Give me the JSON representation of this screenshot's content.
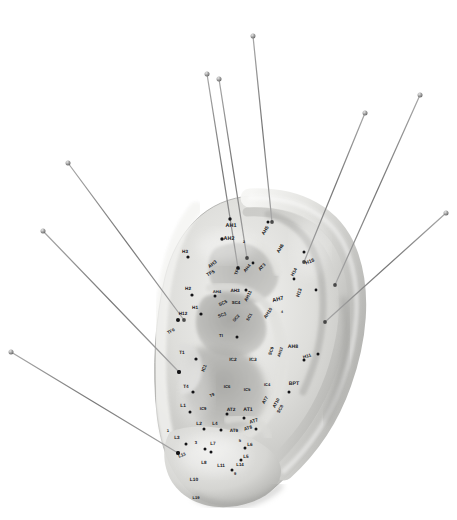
{
  "image": {
    "subject": "auricular-acupuncture-ear-model-with-needles",
    "background_color": "#ffffff",
    "model_color_light": "#e9e9e7",
    "model_color_mid": "#c9c9c6",
    "model_color_shadow": "#9a9a97",
    "needle_color": "#8e8e8e",
    "label_color": "#16161a",
    "point_color": "#131316",
    "width": 457,
    "height": 520
  },
  "needles": [
    {
      "name": "needle-1",
      "handle_x": 207,
      "handle_y": 74,
      "tip_x": 238,
      "tip_y": 268
    },
    {
      "name": "needle-2",
      "handle_x": 219,
      "handle_y": 79,
      "tip_x": 247,
      "tip_y": 258
    },
    {
      "name": "needle-3",
      "handle_x": 253,
      "handle_y": 36,
      "tip_x": 272,
      "tip_y": 222
    },
    {
      "name": "needle-4",
      "handle_x": 365,
      "handle_y": 113,
      "tip_x": 304,
      "tip_y": 262
    },
    {
      "name": "needle-5",
      "handle_x": 420,
      "handle_y": 95,
      "tip_x": 335,
      "tip_y": 285
    },
    {
      "name": "needle-6",
      "handle_x": 446,
      "handle_y": 213,
      "tip_x": 325,
      "tip_y": 322
    },
    {
      "name": "needle-7",
      "handle_x": 68,
      "handle_y": 163,
      "tip_x": 184,
      "tip_y": 320
    },
    {
      "name": "needle-8",
      "handle_x": 43,
      "handle_y": 231,
      "tip_x": 179,
      "tip_y": 372
    },
    {
      "name": "needle-9",
      "handle_x": 11,
      "handle_y": 352,
      "tip_x": 178,
      "tip_y": 453
    }
  ],
  "point_labels": [
    {
      "text": "AH1",
      "x": 231,
      "y": 226,
      "size": 5.4,
      "rot": 0
    },
    {
      "text": "AH2",
      "x": 229,
      "y": 239,
      "size": 5.4,
      "rot": 0
    },
    {
      "text": "2",
      "x": 244,
      "y": 242,
      "size": 3.6,
      "rot": 0
    },
    {
      "text": "AH5",
      "x": 266,
      "y": 231,
      "size": 4.8,
      "rot": -58
    },
    {
      "text": "AH6",
      "x": 281,
      "y": 249,
      "size": 4.8,
      "rot": -58
    },
    {
      "text": "H15",
      "x": 310,
      "y": 262,
      "size": 5.0,
      "rot": -20
    },
    {
      "text": "H14",
      "x": 294,
      "y": 272,
      "size": 4.6,
      "rot": -62
    },
    {
      "text": "AH3",
      "x": 213,
      "y": 265,
      "size": 4.8,
      "rot": -38
    },
    {
      "text": "H3",
      "x": 185,
      "y": 251,
      "size": 4.6,
      "rot": 0
    },
    {
      "text": "H2",
      "x": 188,
      "y": 288,
      "size": 4.6,
      "rot": 0
    },
    {
      "text": "H1",
      "x": 195,
      "y": 307,
      "size": 4.6,
      "rot": 0
    },
    {
      "text": "AH4",
      "x": 247,
      "y": 268,
      "size": 4.4,
      "rot": -52
    },
    {
      "text": "AT3",
      "x": 262,
      "y": 267,
      "size": 4.6,
      "rot": -48
    },
    {
      "text": "AH4",
      "x": 217,
      "y": 291,
      "size": 4.2,
      "rot": 0
    },
    {
      "text": "AH3",
      "x": 235,
      "y": 290,
      "size": 4.6,
      "rot": 0
    },
    {
      "text": "AH11",
      "x": 248,
      "y": 296,
      "size": 4.6,
      "rot": -64
    },
    {
      "text": "AH7",
      "x": 278,
      "y": 300,
      "size": 5.6,
      "rot": -14
    },
    {
      "text": "4",
      "x": 282,
      "y": 312,
      "size": 3.6,
      "rot": 0
    },
    {
      "text": "H13",
      "x": 300,
      "y": 293,
      "size": 4.8,
      "rot": -72
    },
    {
      "text": "SC5",
      "x": 223,
      "y": 303,
      "size": 4.6,
      "rot": -24
    },
    {
      "text": "SC4",
      "x": 236,
      "y": 302,
      "size": 4.4,
      "rot": 0
    },
    {
      "text": "SC3",
      "x": 222,
      "y": 315,
      "size": 4.4,
      "rot": -20
    },
    {
      "text": "SC2",
      "x": 236,
      "y": 318,
      "size": 4.2,
      "rot": -48
    },
    {
      "text": "SC1",
      "x": 249,
      "y": 317,
      "size": 4.2,
      "rot": -62
    },
    {
      "text": "AH10",
      "x": 268,
      "y": 313,
      "size": 4.6,
      "rot": -56
    },
    {
      "text": "H12",
      "x": 183,
      "y": 313,
      "size": 4.6,
      "rot": 0
    },
    {
      "text": "TF6",
      "x": 171,
      "y": 331,
      "size": 4.4,
      "rot": -28
    },
    {
      "text": "TF5",
      "x": 211,
      "y": 274,
      "size": 4.8,
      "rot": -28
    },
    {
      "text": "TF1",
      "x": 237,
      "y": 271,
      "size": 4.4,
      "rot": -70
    },
    {
      "text": "TI",
      "x": 221,
      "y": 335,
      "size": 4.4,
      "rot": 0
    },
    {
      "text": "AH8",
      "x": 293,
      "y": 347,
      "size": 5.2,
      "rot": 0
    },
    {
      "text": "H11",
      "x": 307,
      "y": 356,
      "size": 4.6,
      "rot": -18
    },
    {
      "text": "SC9",
      "x": 271,
      "y": 351,
      "size": 4.4,
      "rot": -70
    },
    {
      "text": "AH12",
      "x": 280,
      "y": 352,
      "size": 4.0,
      "rot": -72
    },
    {
      "text": "T1",
      "x": 182,
      "y": 352,
      "size": 4.6,
      "rot": 0
    },
    {
      "text": "IC1",
      "x": 204,
      "y": 368,
      "size": 4.6,
      "rot": -66
    },
    {
      "text": "IC2",
      "x": 233,
      "y": 360,
      "size": 4.8,
      "rot": 0
    },
    {
      "text": "IC3",
      "x": 253,
      "y": 360,
      "size": 4.8,
      "rot": 0
    },
    {
      "text": "T4",
      "x": 186,
      "y": 386,
      "size": 4.6,
      "rot": 0
    },
    {
      "text": "IC6",
      "x": 227,
      "y": 386,
      "size": 4.2,
      "rot": 0
    },
    {
      "text": "IC5",
      "x": 247,
      "y": 389,
      "size": 4.2,
      "rot": 0
    },
    {
      "text": "IC4",
      "x": 267,
      "y": 384,
      "size": 4.0,
      "rot": 0
    },
    {
      "text": "BPT",
      "x": 294,
      "y": 384,
      "size": 5.2,
      "rot": 0
    },
    {
      "text": "AT7",
      "x": 265,
      "y": 400,
      "size": 4.4,
      "rot": -60
    },
    {
      "text": "AT10",
      "x": 276,
      "y": 403,
      "size": 4.4,
      "rot": -62
    },
    {
      "text": "SC8",
      "x": 280,
      "y": 409,
      "size": 4.4,
      "rot": -62
    },
    {
      "text": "L1",
      "x": 183,
      "y": 406,
      "size": 4.8,
      "rot": 0
    },
    {
      "text": "IC9",
      "x": 203,
      "y": 408,
      "size": 4.2,
      "rot": 0
    },
    {
      "text": "T9",
      "x": 212,
      "y": 395,
      "size": 4.2,
      "rot": -20
    },
    {
      "text": "AT2",
      "x": 231,
      "y": 410,
      "size": 4.8,
      "rot": 0
    },
    {
      "text": "AT1",
      "x": 248,
      "y": 410,
      "size": 5.2,
      "rot": 0
    },
    {
      "text": "AT7",
      "x": 254,
      "y": 422,
      "size": 4.8,
      "rot": -18
    },
    {
      "text": "AT9",
      "x": 234,
      "y": 430,
      "size": 4.6,
      "rot": 0
    },
    {
      "text": "AT8",
      "x": 248,
      "y": 428,
      "size": 4.6,
      "rot": -18
    },
    {
      "text": "L2",
      "x": 199,
      "y": 424,
      "size": 4.8,
      "rot": 0
    },
    {
      "text": "L4",
      "x": 215,
      "y": 423,
      "size": 4.6,
      "rot": 0
    },
    {
      "text": "1",
      "x": 168,
      "y": 430,
      "size": 4.2,
      "rot": 0
    },
    {
      "text": "L3",
      "x": 177,
      "y": 437,
      "size": 4.6,
      "rot": 0
    },
    {
      "text": "3",
      "x": 196,
      "y": 442,
      "size": 4.2,
      "rot": 0
    },
    {
      "text": "L7",
      "x": 213,
      "y": 443,
      "size": 4.6,
      "rot": 0
    },
    {
      "text": "5",
      "x": 240,
      "y": 440,
      "size": 4.2,
      "rot": 0
    },
    {
      "text": "L6",
      "x": 250,
      "y": 444,
      "size": 4.6,
      "rot": 0
    },
    {
      "text": "L5",
      "x": 246,
      "y": 456,
      "size": 4.6,
      "rot": 0
    },
    {
      "text": "L13",
      "x": 182,
      "y": 455,
      "size": 4.4,
      "rot": -22
    },
    {
      "text": "L8",
      "x": 204,
      "y": 462,
      "size": 4.6,
      "rot": 0
    },
    {
      "text": "L11",
      "x": 221,
      "y": 465,
      "size": 4.6,
      "rot": 0
    },
    {
      "text": "L14",
      "x": 240,
      "y": 464,
      "size": 4.4,
      "rot": 0
    },
    {
      "text": "9",
      "x": 235,
      "y": 473,
      "size": 4.0,
      "rot": 0
    },
    {
      "text": "L10",
      "x": 194,
      "y": 480,
      "size": 4.8,
      "rot": 0
    },
    {
      "text": "L19",
      "x": 196,
      "y": 497,
      "size": 4.0,
      "rot": 0
    }
  ],
  "points": [
    {
      "x": 230,
      "y": 219,
      "r": 1.7
    },
    {
      "x": 222,
      "y": 239,
      "r": 1.7
    },
    {
      "x": 268,
      "y": 222,
      "r": 1.5
    },
    {
      "x": 304,
      "y": 252,
      "r": 1.5
    },
    {
      "x": 188,
      "y": 257,
      "r": 1.6
    },
    {
      "x": 192,
      "y": 295,
      "r": 1.6
    },
    {
      "x": 201,
      "y": 314,
      "r": 1.6
    },
    {
      "x": 238,
      "y": 268,
      "r": 1.4
    },
    {
      "x": 253,
      "y": 263,
      "r": 1.4
    },
    {
      "x": 215,
      "y": 296,
      "r": 1.5
    },
    {
      "x": 246,
      "y": 290,
      "r": 1.5
    },
    {
      "x": 178,
      "y": 320,
      "r": 2.0
    },
    {
      "x": 237,
      "y": 337,
      "r": 1.5
    },
    {
      "x": 196,
      "y": 359,
      "r": 1.6
    },
    {
      "x": 179,
      "y": 372,
      "r": 2.0
    },
    {
      "x": 193,
      "y": 392,
      "r": 1.6
    },
    {
      "x": 304,
      "y": 360,
      "r": 1.5
    },
    {
      "x": 318,
      "y": 354,
      "r": 1.5
    },
    {
      "x": 289,
      "y": 392,
      "r": 1.5
    },
    {
      "x": 190,
      "y": 412,
      "r": 1.5
    },
    {
      "x": 227,
      "y": 414,
      "r": 1.5
    },
    {
      "x": 244,
      "y": 418,
      "r": 1.5
    },
    {
      "x": 256,
      "y": 429,
      "r": 1.5
    },
    {
      "x": 204,
      "y": 429,
      "r": 1.5
    },
    {
      "x": 221,
      "y": 430,
      "r": 1.5
    },
    {
      "x": 186,
      "y": 444,
      "r": 1.5
    },
    {
      "x": 205,
      "y": 449,
      "r": 1.5
    },
    {
      "x": 245,
      "y": 448,
      "r": 1.5
    },
    {
      "x": 241,
      "y": 460,
      "r": 1.5
    },
    {
      "x": 178,
      "y": 453,
      "r": 2.0
    },
    {
      "x": 211,
      "y": 452,
      "r": 1.5
    },
    {
      "x": 232,
      "y": 470,
      "r": 1.5
    },
    {
      "x": 316,
      "y": 290,
      "r": 1.4
    },
    {
      "x": 294,
      "y": 279,
      "r": 1.4
    }
  ]
}
